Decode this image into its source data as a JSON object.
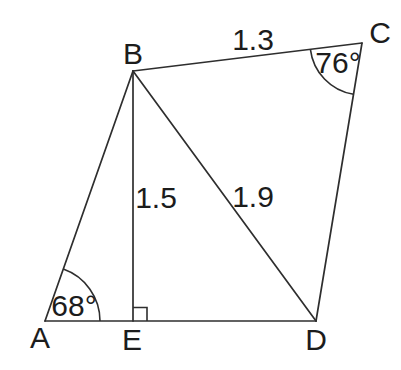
{
  "diagram": {
    "vertex_labels": {
      "A": "A",
      "B": "B",
      "C": "C",
      "D": "D",
      "E": "E"
    },
    "side_labels": {
      "BC": "1.3",
      "BE": "1.5",
      "BD": "1.9"
    },
    "angle_labels": {
      "A": "68°",
      "C": "76°"
    },
    "colors": {
      "stroke": "#2e2e2e",
      "text": "#1c1c1c",
      "background": "#ffffff"
    }
  }
}
